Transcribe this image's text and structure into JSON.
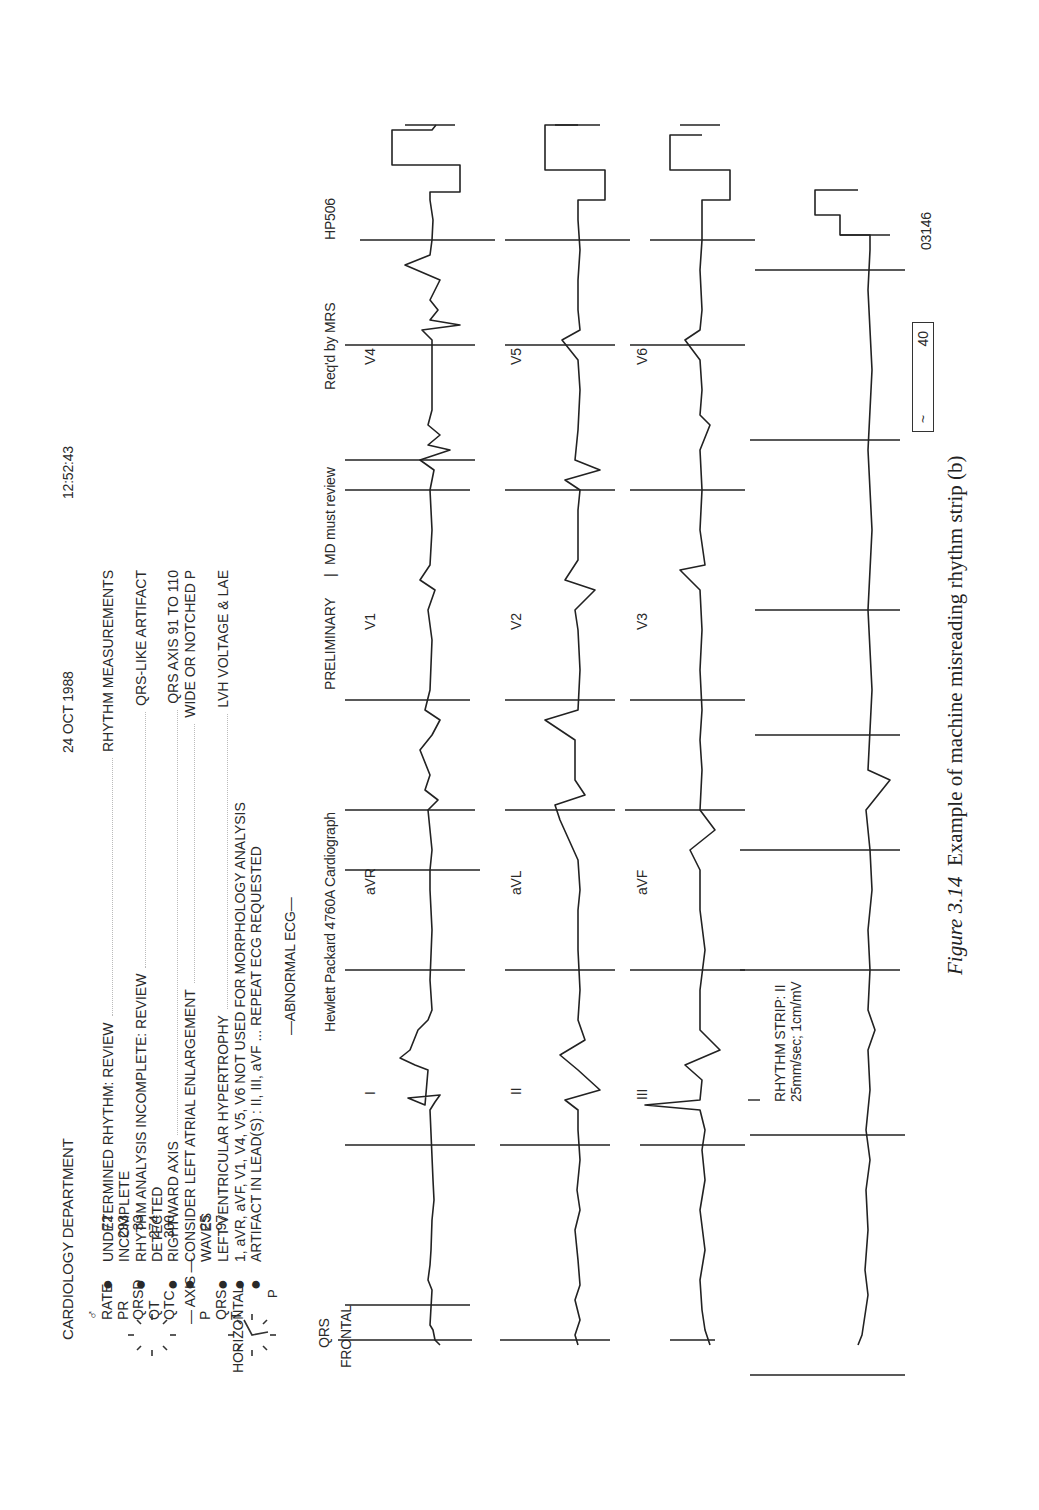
{
  "header": {
    "department": "CARDIOLOGY DEPARTMENT",
    "date": "24 OCT 1988",
    "time": "12:52:43",
    "sex_symbol": "♂",
    "device_id": "HP506"
  },
  "measurements": [
    {
      "label": "RATE",
      "value": "72"
    },
    {
      "label": "PR",
      "value": "293"
    },
    {
      "label": "QRSD",
      "value": "33"
    },
    {
      "label": "QT",
      "value": "274"
    },
    {
      "label": "QTC",
      "value": "300"
    }
  ],
  "axis": {
    "title": "— AXIS —",
    "rows": [
      {
        "label": "P",
        "value": "25"
      },
      {
        "label": "QRS",
        "value": "97"
      },
      {
        "label": "T",
        "value": ""
      }
    ]
  },
  "vector_diagrams": {
    "horizontal_label": "HORIZONTAL",
    "frontal_label": "FRONTAL",
    "frontal_p_label": "P",
    "frontal_qrs_label": "QRS"
  },
  "statements": [
    {
      "bullet": true,
      "left": "UNDETERMINED RHYTHM: REVIEW",
      "right": "RHYTHM MEASUREMENTS"
    },
    {
      "bullet": false,
      "left": "INCOMPLETE",
      "right": ""
    },
    {
      "bullet": true,
      "left": "RHYTHM ANALYSIS INCOMPLETE: REVIEW",
      "right": "QRS-LIKE ARTIFACT"
    },
    {
      "bullet": false,
      "left": "DETECTED",
      "right": ""
    },
    {
      "bullet": true,
      "left": "RIGHTWARD AXIS",
      "right": "QRS AXIS 91 TO 110"
    },
    {
      "bullet": true,
      "left": "CONSIDER LEFT ATRIAL ENLARGEMENT",
      "right": "WIDE OR NOTCHED P"
    },
    {
      "bullet": false,
      "left": "WAVES",
      "right": ""
    },
    {
      "bullet": true,
      "left": "LEFT VENTRICULAR HYPERTROPHY",
      "right": "LVH VOLTAGE & LAE"
    },
    {
      "bullet": true,
      "left": "1, aVR, aVF, V1, V4, V5, V6 NOT USED FOR MORPHOLOGY ANALYSIS",
      "right": ""
    },
    {
      "bullet": true,
      "left": "ARTIFACT IN LEAD(S) : II, III, aVF ... REPEAT ECG REQUESTED",
      "right": ""
    }
  ],
  "interpretation": "—ABNORMAL ECG—",
  "device": "Hewlett Packard 4760A Cardiograph",
  "status": {
    "preliminary": "PRELIMINARY",
    "separator": "|",
    "review": "MD must review",
    "requested_by": "Req'd by MRS"
  },
  "leads": {
    "row1": [
      "I",
      "aVR",
      "V1",
      "V4"
    ],
    "row2": [
      "II",
      "aVL",
      "V2",
      "V5"
    ],
    "row3": [
      "III",
      "aVF",
      "V3",
      "V6"
    ]
  },
  "rhythm_strip": {
    "title": "RHYTHM STRIP: II",
    "settings": "25mm/sec; 1cm/mV"
  },
  "footer": {
    "box_left": "~",
    "box_right": "40",
    "record_id": "03146"
  },
  "caption": {
    "figure": "Figure 3.14",
    "text": "Example of machine misreading rhythm strip (b)"
  }
}
